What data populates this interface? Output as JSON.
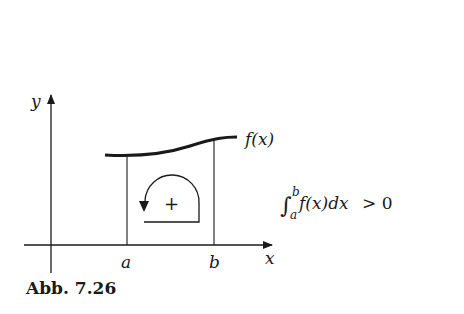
{
  "figure": {
    "caption": "Abb. 7.26",
    "axes": {
      "x_label": "x",
      "y_label": "y"
    },
    "bounds": {
      "lower_label": "a",
      "upper_label": "b"
    },
    "curve_label": "f(x)",
    "orientation_sign": "+",
    "formula": {
      "integral_sign": "∫",
      "upper_limit": "b",
      "lower_limit": "a",
      "integrand": "f(x)dx",
      "relation": "> 0"
    },
    "colors": {
      "ink": "#1a1a1a",
      "background": "#ffffff"
    }
  }
}
